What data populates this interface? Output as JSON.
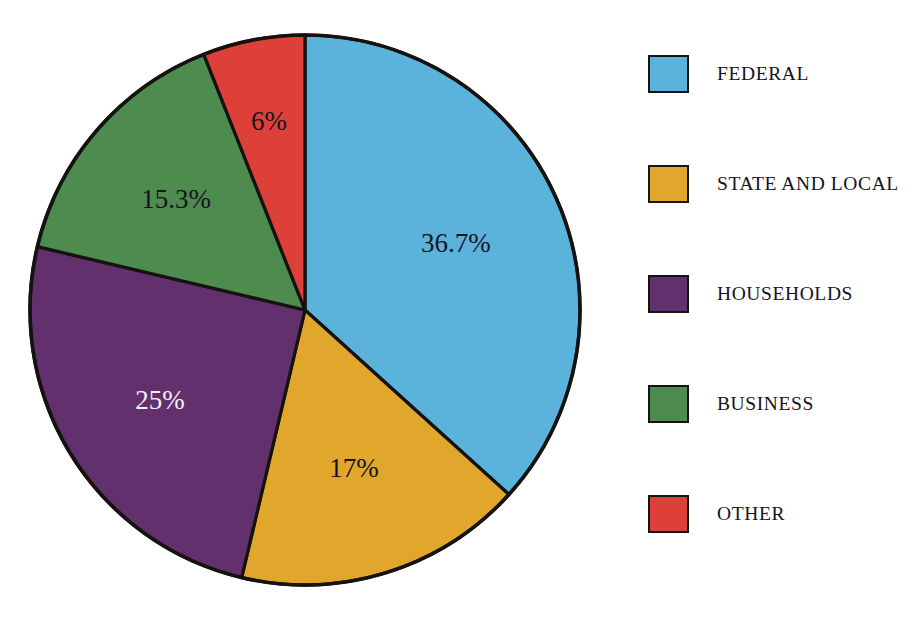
{
  "chart_data": {
    "type": "pie",
    "title": "",
    "subtitle": "",
    "xlabel": "",
    "ylabel": "",
    "grid": false,
    "legend_position": "right",
    "start_angle_deg": 0,
    "direction": "clockwise",
    "categories": [
      "FEDERAL",
      "STATE AND LOCAL",
      "HOUSEHOLDS",
      "BUSINESS",
      "OTHER"
    ],
    "values": [
      36.7,
      17,
      25,
      15.3,
      6
    ],
    "value_labels": [
      "36.7%",
      "17%",
      "25%",
      "15.3%",
      "6%"
    ],
    "colors": [
      "#5bb3dc",
      "#e0a72c",
      "#63306e",
      "#4e8b4e",
      "#dc4038"
    ],
    "label_text_colors": [
      "#17141f",
      "#17141f",
      "#f4f1f5",
      "#17141f",
      "#17141f"
    ],
    "slices": [
      {
        "label": "FEDERAL",
        "value": 36.7,
        "value_label": "36.7%",
        "color": "#5bb3dc",
        "label_color": "#17141f"
      },
      {
        "label": "STATE AND LOCAL",
        "value": 17,
        "value_label": "17%",
        "color": "#e0a72c",
        "label_color": "#17141f"
      },
      {
        "label": "HOUSEHOLDS",
        "value": 25,
        "value_label": "25%",
        "color": "#63306e",
        "label_color": "#f4f1f5"
      },
      {
        "label": "BUSINESS",
        "value": 15.3,
        "value_label": "15.3%",
        "color": "#4e8b4e",
        "label_color": "#17141f"
      },
      {
        "label": "OTHER",
        "value": 6,
        "value_label": "6%",
        "color": "#dc4038",
        "label_color": "#17141f"
      }
    ]
  },
  "legend": {
    "items": [
      {
        "label": "FEDERAL",
        "color": "#5bb3dc"
      },
      {
        "label": "STATE AND LOCAL",
        "color": "#e0a72c"
      },
      {
        "label": "HOUSEHOLDS",
        "color": "#63306e"
      },
      {
        "label": "BUSINESS",
        "color": "#4e8b4e"
      },
      {
        "label": "OTHER",
        "color": "#dc4038"
      }
    ]
  },
  "style": {
    "background": "#ffffff",
    "outline_color": "#15120f"
  }
}
